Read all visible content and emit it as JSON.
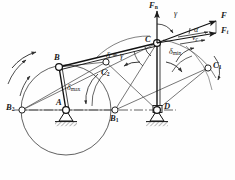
{
  "figure": {
    "type": "mechanism-kinematic-diagram",
    "stroke_color": "#1a1a1a",
    "thin_color": "#555555",
    "caption": ""
  },
  "joints": [
    {
      "id": "A",
      "label": "A",
      "sub": "",
      "x": 66,
      "y": 110,
      "kind": "fixed-pivot",
      "label_dx": -9,
      "label_dy": -10
    },
    {
      "id": "D",
      "label": "D",
      "sub": "",
      "x": 157,
      "y": 110,
      "kind": "fixed-pivot",
      "label_dx": 8,
      "label_dy": -6
    },
    {
      "id": "B",
      "label": "B",
      "sub": "",
      "x": 59,
      "y": 67,
      "kind": "moving-pivot",
      "label_dx": -3,
      "label_dy": -12
    },
    {
      "id": "C",
      "label": "C",
      "sub": "",
      "x": 157,
      "y": 43,
      "kind": "moving-pivot",
      "label_dx": -11,
      "label_dy": -6
    },
    {
      "id": "B1",
      "label": "B",
      "sub": "1",
      "x": 115,
      "y": 110,
      "kind": "position-pt",
      "label_dx": -2,
      "label_dy": 3
    },
    {
      "id": "B2",
      "label": "B",
      "sub": "2",
      "x": 22,
      "y": 110,
      "kind": "position-pt",
      "label_dx": -13,
      "label_dy": -5
    },
    {
      "id": "C1",
      "label": "C",
      "sub": "1",
      "x": 208,
      "y": 68,
      "kind": "position-pt",
      "label_dx": 6,
      "label_dy": -5
    },
    {
      "id": "C2",
      "label": "C",
      "sub": "2",
      "x": 106,
      "y": 62,
      "kind": "position-pt",
      "label_dx": 0,
      "label_dy": 9
    }
  ],
  "links": [
    {
      "name": "crank-AB",
      "from": "A",
      "to": "B",
      "weight": "heavy"
    },
    {
      "name": "coupler-BC",
      "from": "B",
      "to": "C",
      "weight": "heavy"
    },
    {
      "name": "rocker-DC",
      "from": "D",
      "to": "C",
      "weight": "heavy"
    },
    {
      "name": "crank-AB1",
      "from": "A",
      "to": "B1",
      "weight": "light"
    },
    {
      "name": "crank-AB2",
      "from": "A",
      "to": "B2",
      "weight": "light"
    },
    {
      "name": "coupler-B1C1",
      "from": "B1",
      "to": "C1",
      "weight": "light"
    },
    {
      "name": "coupler-B2C2",
      "from": "B2",
      "to": "C2",
      "weight": "light"
    },
    {
      "name": "rocker-DC1",
      "from": "D",
      "to": "C1",
      "weight": "light"
    },
    {
      "name": "rocker-DC2",
      "from": "D",
      "to": "C2",
      "weight": "light"
    },
    {
      "name": "frame-AD",
      "from": "A",
      "to": "D",
      "weight": "center-line"
    }
  ],
  "angles": [
    {
      "id": "delta-eq-gamma",
      "text": "δ = γ",
      "x": 108,
      "y": 56,
      "name": "transmission-angle-label"
    },
    {
      "id": "delta-max",
      "text": "δ",
      "subtext": "max",
      "x": 72,
      "y": 88,
      "name": "delta-max-label"
    },
    {
      "id": "delta-min",
      "text": "δ",
      "subtext": "min",
      "x": 172,
      "y": 52,
      "name": "delta-min-label"
    },
    {
      "id": "gamma",
      "text": "γ",
      "x": 176,
      "y": 15,
      "name": "gamma-angle-label"
    },
    {
      "id": "alpha",
      "text": "α",
      "x": 196,
      "y": 32,
      "name": "alpha-angle-label"
    }
  ],
  "forces": [
    {
      "id": "Fn",
      "label": "F",
      "sub": "n",
      "x": 152,
      "y": 3,
      "name": "normal-force-label"
    },
    {
      "id": "F",
      "label": "F",
      "sub": "",
      "x": 223,
      "y": 16,
      "name": "resultant-force-label"
    },
    {
      "id": "Ft",
      "label": "F",
      "sub": "t",
      "x": 223,
      "y": 31,
      "name": "tangential-force-label"
    }
  ],
  "velocity": {
    "id": "vc",
    "label": "v",
    "sub": "c",
    "x": 194,
    "y": 40,
    "name": "velocity-label"
  },
  "rotation_arrows": [
    {
      "name": "crank-rotation-arrow",
      "position": "left-outer"
    },
    {
      "name": "rocker-sweep-arrow",
      "position": "center"
    },
    {
      "name": "rocker-sweep-arrow-2",
      "position": "right"
    }
  ]
}
